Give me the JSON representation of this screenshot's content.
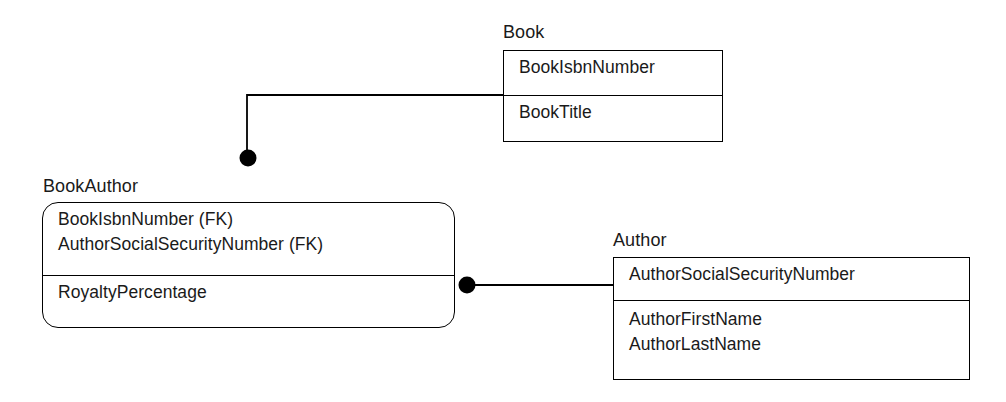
{
  "diagram": {
    "type": "entity-relationship-diagram",
    "notation": "IDEF1X",
    "background_color": "#ffffff",
    "line_color": "#000000",
    "text_color": "#1a1a1a",
    "entities": [
      {
        "id": "book",
        "name": "Book",
        "shape": "square-corners",
        "identifying": true,
        "key_attributes": [
          "BookIsbnNumber"
        ],
        "non_key_attributes": [
          "BookTitle"
        ],
        "bounds": {
          "x": 503,
          "y": 50,
          "width": 220,
          "height": 92,
          "divider_y": 95
        },
        "label_position": {
          "x": 503,
          "y": 22
        }
      },
      {
        "id": "bookauthor",
        "name": "BookAuthor",
        "shape": "rounded-corners",
        "identifying": false,
        "key_attributes": [
          "BookIsbnNumber (FK)",
          "AuthorSocialSecurityNumber (FK)"
        ],
        "non_key_attributes": [
          "RoyaltyPercentage"
        ],
        "bounds": {
          "x": 42,
          "y": 202,
          "width": 413,
          "height": 126,
          "divider_y": 277
        },
        "label_position": {
          "x": 43,
          "y": 176
        }
      },
      {
        "id": "author",
        "name": "Author",
        "shape": "square-corners",
        "identifying": true,
        "key_attributes": [
          "AuthorSocialSecurityNumber"
        ],
        "non_key_attributes": [
          "AuthorFirstName",
          "AuthorLastName"
        ],
        "bounds": {
          "x": 613,
          "y": 257,
          "width": 357,
          "height": 123,
          "divider_y": 300
        },
        "label_position": {
          "x": 613,
          "y": 230
        }
      }
    ],
    "relationships": [
      {
        "id": "book-to-bookauthor",
        "from": "book",
        "to": "bookauthor",
        "cardinality_marker": "filled-circle",
        "marker_end": "bookauthor",
        "marker_position": {
          "x": 248,
          "y": 158,
          "radius": 8
        },
        "path": "M 503 95 L 247 95 L 247 150"
      },
      {
        "id": "author-to-bookauthor",
        "from": "author",
        "to": "bookauthor",
        "cardinality_marker": "filled-circle",
        "marker_end": "bookauthor",
        "marker_position": {
          "x": 467,
          "y": 285,
          "radius": 8
        },
        "path": "M 613 285 L 475 285"
      }
    ]
  }
}
